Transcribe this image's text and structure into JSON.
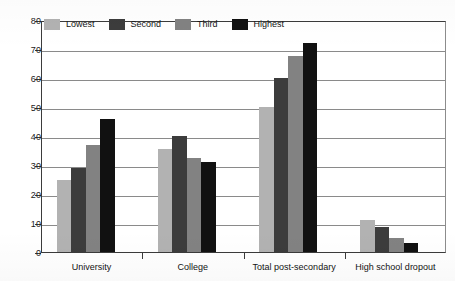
{
  "chart_data": {
    "type": "bar",
    "title": "",
    "subtitle": "",
    "xlabel": "",
    "ylabel": "",
    "ylim": [
      0,
      80
    ],
    "ytick_step": 10,
    "yticks": [
      0,
      10,
      20,
      30,
      40,
      50,
      60,
      70,
      80
    ],
    "ytick_labels": [
      "0",
      "10",
      "20",
      "30",
      "40",
      "50",
      "60",
      "70",
      "80"
    ],
    "grid": true,
    "grid_axis": "y",
    "legend_position": "top-left-inside",
    "categories": [
      "University",
      "College",
      "Total post-secondary",
      "High school dropout"
    ],
    "series": [
      {
        "name": "Lowest",
        "color": "#b2b2b2",
        "values": [
          25,
          35.5,
          50,
          11
        ]
      },
      {
        "name": "Second",
        "color": "#3c3c3c",
        "values": [
          29,
          40,
          60,
          8.5
        ]
      },
      {
        "name": "Third",
        "color": "#828282",
        "values": [
          37,
          32.5,
          67.5,
          5
        ]
      },
      {
        "name": "Highest",
        "color": "#111111",
        "values": [
          46,
          31,
          72,
          3
        ]
      }
    ]
  },
  "legend": {
    "items": [
      {
        "label": "Lowest",
        "swatch_name": "legend-swatch-lowest",
        "color": "#b2b2b2"
      },
      {
        "label": "Second",
        "swatch_name": "legend-swatch-second",
        "color": "#3c3c3c"
      },
      {
        "label": "Third",
        "swatch_name": "legend-swatch-third",
        "color": "#828282"
      },
      {
        "label": "Highest",
        "swatch_name": "legend-swatch-highest",
        "color": "#111111"
      }
    ]
  },
  "axes": {
    "y_labels": [
      "80",
      "70",
      "60",
      "50",
      "40",
      "30",
      "20",
      "10",
      "0"
    ],
    "x_labels": [
      "University",
      "College",
      "Total post-secondary",
      "High school dropout"
    ]
  },
  "colors": {
    "axis": "#3b3b3b",
    "grid": "#8a8a8a",
    "text": "#131313",
    "background": "#ffffff"
  }
}
